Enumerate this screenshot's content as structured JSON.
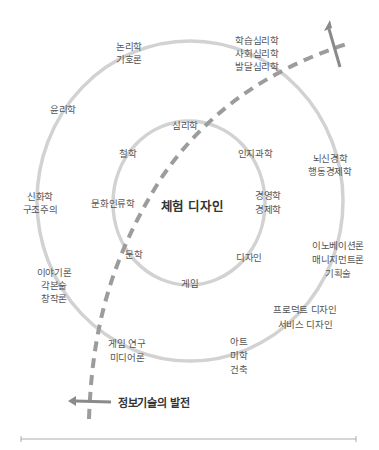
{
  "diagram": {
    "center_label": "체험 디자인",
    "inner_ring": [
      {
        "id": "psychology",
        "lines": [
          "심리학"
        ],
        "x": 185,
        "y": 118
      },
      {
        "id": "philosophy",
        "lines": [
          "철학"
        ],
        "x": 128,
        "y": 145
      },
      {
        "id": "cognitive-science",
        "lines": [
          "인지과학"
        ],
        "x": 256,
        "y": 145
      },
      {
        "id": "cultural-anthropology",
        "lines": [
          "문화인류학"
        ],
        "x": 113,
        "y": 195
      },
      {
        "id": "business-economics",
        "lines": [
          "경영학",
          "경제학"
        ],
        "x": 268,
        "y": 189
      },
      {
        "id": "literature",
        "lines": [
          "문학"
        ],
        "x": 134,
        "y": 247
      },
      {
        "id": "design",
        "lines": [
          "디자인"
        ],
        "x": 249,
        "y": 250
      },
      {
        "id": "game",
        "lines": [
          "게임"
        ],
        "x": 190,
        "y": 276
      }
    ],
    "outer_ring": [
      {
        "id": "logic-semiotics",
        "lines": [
          "논리학",
          "기호론"
        ],
        "x": 129,
        "y": 40
      },
      {
        "id": "psychology-branches",
        "lines": [
          "학습심리학",
          "사회심리학",
          "발달심리학"
        ],
        "x": 257,
        "y": 33
      },
      {
        "id": "ethics",
        "lines": [
          "윤리학"
        ],
        "x": 63,
        "y": 101
      },
      {
        "id": "neuroeconomics",
        "lines": [
          "뇌신경학",
          "행동경제학"
        ],
        "x": 329,
        "y": 153
      },
      {
        "id": "mythology-structuralism",
        "lines": [
          "신화학",
          "구조주의"
        ],
        "x": 40,
        "y": 189
      },
      {
        "id": "innovation-management",
        "lines": [
          "이노베이션론",
          "매니지먼트론",
          "기획술"
        ],
        "x": 338,
        "y": 235
      },
      {
        "id": "narrative-theory",
        "lines": [
          "이야기론",
          "각본술",
          "창작론"
        ],
        "x": 54,
        "y": 264
      },
      {
        "id": "product-service-design",
        "lines": [
          "프로덕트 디자인",
          "서비스 디자인"
        ],
        "x": 301,
        "y": 301
      },
      {
        "id": "game-studies-media",
        "lines": [
          "게임 연구",
          "미디어론"
        ],
        "x": 123,
        "y": 335
      },
      {
        "id": "art-aesthetics-architecture",
        "lines": [
          "아트",
          "미학",
          "건축"
        ],
        "x": 242,
        "y": 335
      }
    ],
    "it_arrow_label": "정보기술의 발전",
    "colors": {
      "circle": "#d0d0d0",
      "dashed_path": "#999999",
      "arrow": "#8a8a8a",
      "text": "#555555",
      "center_text": "#333333",
      "axis": "#888888"
    }
  }
}
